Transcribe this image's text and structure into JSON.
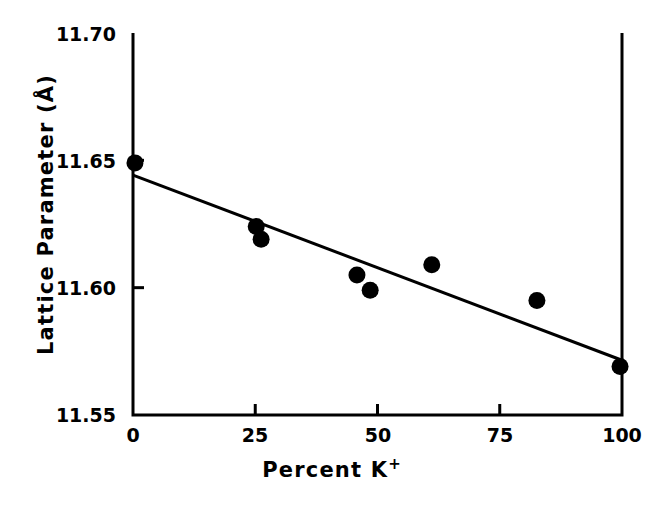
{
  "chart_data": {
    "type": "scatter",
    "title": "",
    "xlabel": "Percent K",
    "xlabel_superscript": "+",
    "xlabel_full": "Percent K+",
    "ylabel": "Lattice Parameter (Å)",
    "xlim": [
      0,
      100
    ],
    "ylim": [
      11.55,
      11.7
    ],
    "xticks": [
      0,
      25,
      50,
      75,
      100
    ],
    "xtick_labels": [
      "0",
      "25",
      "50",
      "75",
      "100"
    ],
    "yticks": [
      11.55,
      11.6,
      11.65,
      11.7
    ],
    "ytick_labels": [
      "11.55",
      "11.60",
      "11.65",
      "11.70"
    ],
    "grid": false,
    "legend": null,
    "marker": "filled-circle",
    "marker_color": "#000000",
    "line_color": "#000000",
    "series": [
      {
        "name": "Lattice parameter measurements",
        "x": [
          0.4,
          25.2,
          26.2,
          45.8,
          48.5,
          61.1,
          82.6,
          99.6
        ],
        "y": [
          11.649,
          11.624,
          11.619,
          11.605,
          11.599,
          11.609,
          11.595,
          11.569
        ]
      }
    ],
    "fit_line": {
      "name": "Linear fit",
      "x": [
        0,
        100
      ],
      "y": [
        11.6442,
        11.5715
      ],
      "slope": -0.000727,
      "intercept": 11.6442
    }
  },
  "axes": {
    "ylabel_text": "Lattice Parameter (Å)",
    "xlabel_text": "Percent K",
    "xlabel_sup": "+"
  }
}
